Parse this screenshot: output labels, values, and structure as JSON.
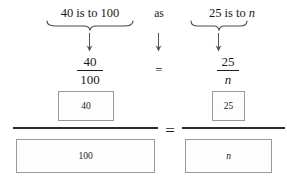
{
  "diagram": {
    "statement": {
      "left_text_prefix": "40 is to 100",
      "connector": "as",
      "right_text_prefix": "25 is to ",
      "right_unknown": "n"
    },
    "fractions": {
      "left": {
        "numerator": "40",
        "denominator": "100"
      },
      "equals": "=",
      "right": {
        "numerator": "25",
        "denominator": "n"
      }
    },
    "bar_model": {
      "equals": "=",
      "left": {
        "numerator_box": "40",
        "denominator_box": "100"
      },
      "right": {
        "numerator_box": "25",
        "denominator_box": "n"
      }
    },
    "icons": {
      "left_brace": "underbrace-icon",
      "right_brace": "underbrace-icon",
      "left_arrow": "down-arrow-icon",
      "middle_arrow": "down-arrow-icon",
      "right_arrow": "down-arrow-icon"
    },
    "colors": {
      "background": "#ffffff",
      "text": "#1a1a1a",
      "box_border": "#9a9a9a",
      "box_fill": "#fdfdfd",
      "rule": "#2b2b2b",
      "brace": "#4a4a4a"
    }
  }
}
